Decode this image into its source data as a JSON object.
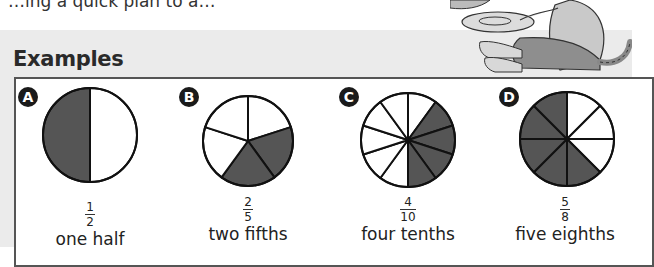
{
  "page": {
    "top_text_partial": "…ing a quick plan to a…",
    "section_heading": "Examples"
  },
  "chart_data": {
    "type": "pie",
    "title": "Examples",
    "shaded_color": "#555555",
    "unshaded_color": "#ffffff",
    "examples": [
      {
        "badge": "A",
        "numerator": 1,
        "denominator": 2,
        "words": "one half",
        "shaded_sectors": [
          1
        ],
        "sectors": 2
      },
      {
        "badge": "B",
        "numerator": 2,
        "denominator": 5,
        "words": "two fifths",
        "shaded_sectors": [
          1,
          2
        ],
        "sectors": 5
      },
      {
        "badge": "C",
        "numerator": 4,
        "denominator": 10,
        "words": "four tenths",
        "shaded_sectors": [
          1,
          2,
          3,
          4
        ],
        "sectors": 10
      },
      {
        "badge": "D",
        "numerator": 5,
        "denominator": 8,
        "words": "five eighths",
        "shaded_sectors": [
          3,
          4,
          5,
          6,
          7
        ],
        "sectors": 8
      }
    ]
  }
}
